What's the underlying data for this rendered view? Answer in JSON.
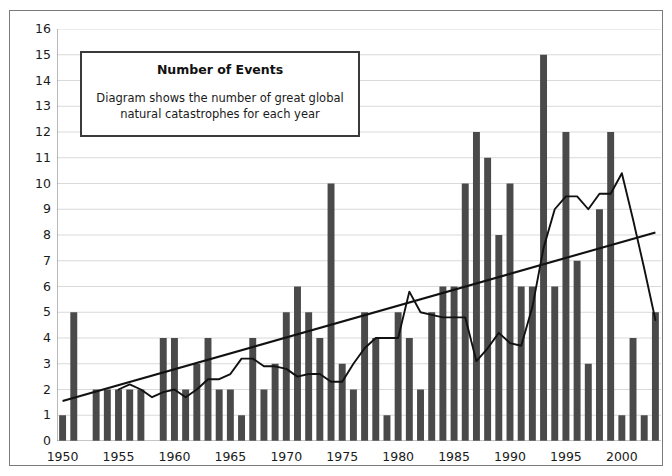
{
  "legend": {
    "title": "Number of Events",
    "description_line1": "Diagram shows the number of great global",
    "description_line2": "natural catastrophes for each year"
  },
  "colors": {
    "bar": "#4a4a4a",
    "trend_line": "#111111",
    "moving_average": "#111111",
    "grid": "#d9d9d9",
    "axis": "#8c8c8c",
    "frame": "#7a7a7a",
    "text": "#1a1a1a"
  },
  "chart_data": {
    "type": "bar",
    "title": "Number of Events",
    "subtitle": "Diagram shows the number of great global natural catastrophes for each year",
    "xlabel": "",
    "ylabel": "",
    "ylim": [
      0,
      16
    ],
    "ytick_values": [
      0,
      1,
      2,
      3,
      4,
      5,
      6,
      7,
      8,
      9,
      10,
      11,
      12,
      13,
      14,
      15,
      16
    ],
    "ytick_labels": [
      "0",
      "1",
      "2",
      "3",
      "4",
      "5",
      "6",
      "7",
      "8",
      "9",
      "10",
      "11",
      "12",
      "13",
      "14",
      "15",
      "16"
    ],
    "xtick_labels": [
      "1950",
      "1955",
      "1960",
      "1965",
      "1970",
      "1975",
      "1980",
      "1985",
      "1990",
      "1995",
      "2000"
    ],
    "xtick_years": [
      1950,
      1955,
      1960,
      1965,
      1970,
      1975,
      1980,
      1985,
      1990,
      1995,
      2000
    ],
    "xlim": [
      1949.5,
      2003.5
    ],
    "grid": true,
    "legend_position": "inside-top-left",
    "categories": [
      1950,
      1951,
      1952,
      1953,
      1954,
      1955,
      1956,
      1957,
      1958,
      1959,
      1960,
      1961,
      1962,
      1963,
      1964,
      1965,
      1966,
      1967,
      1968,
      1969,
      1970,
      1971,
      1972,
      1973,
      1974,
      1975,
      1976,
      1977,
      1978,
      1979,
      1980,
      1981,
      1982,
      1983,
      1984,
      1985,
      1986,
      1987,
      1988,
      1989,
      1990,
      1991,
      1992,
      1993,
      1994,
      1995,
      1996,
      1997,
      1998,
      1999,
      2000,
      2001,
      2002,
      2003
    ],
    "values": [
      1,
      5,
      0,
      2,
      2,
      2,
      2,
      2,
      0,
      4,
      4,
      2,
      3,
      4,
      2,
      2,
      1,
      4,
      2,
      3,
      5,
      6,
      5,
      4,
      10,
      3,
      2,
      5,
      4,
      1,
      5,
      4,
      2,
      5,
      6,
      6,
      10,
      12,
      11,
      8,
      10,
      6,
      6,
      15,
      6,
      12,
      7,
      3,
      9,
      12,
      1,
      4,
      1,
      5
    ],
    "series": [
      {
        "name": "Number of great natural catastrophes",
        "type": "bar",
        "values": [
          1,
          5,
          0,
          2,
          2,
          2,
          2,
          2,
          0,
          4,
          4,
          2,
          3,
          4,
          2,
          2,
          1,
          4,
          2,
          3,
          5,
          6,
          5,
          4,
          10,
          3,
          2,
          5,
          4,
          1,
          5,
          4,
          2,
          5,
          6,
          6,
          10,
          12,
          11,
          8,
          10,
          6,
          6,
          15,
          6,
          12,
          7,
          3,
          9,
          12,
          1,
          4,
          1,
          5
        ]
      },
      {
        "name": "Moving average",
        "type": "line",
        "values": [
          null,
          null,
          null,
          null,
          null,
          2.0,
          2.2,
          2.0,
          1.7,
          1.9,
          2.0,
          1.7,
          2.0,
          2.4,
          2.4,
          2.6,
          3.2,
          3.2,
          2.9,
          2.9,
          2.8,
          2.5,
          2.6,
          2.6,
          2.3,
          2.3,
          3.0,
          3.6,
          4.0,
          4.0,
          4.0,
          5.8,
          5.0,
          4.9,
          4.8,
          4.8,
          4.8,
          3.1,
          3.6,
          4.2,
          3.8,
          3.7,
          5.2,
          7.5,
          9.0,
          9.5,
          9.5,
          9.0,
          9.6,
          9.6,
          10.4,
          8.6,
          6.7,
          4.7
        ]
      },
      {
        "name": "Linear trend",
        "type": "line",
        "start_point": {
          "x": 1950,
          "y": 1.55
        },
        "end_point": {
          "x": 2003,
          "y": 8.1
        }
      }
    ]
  }
}
